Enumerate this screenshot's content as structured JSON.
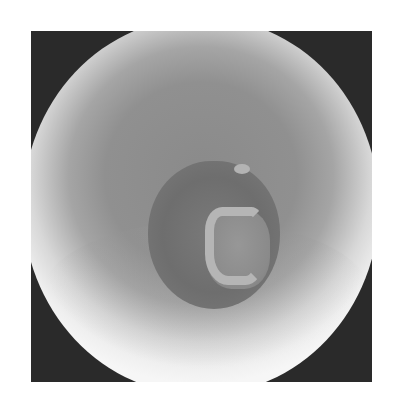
{
  "image": {
    "description": "Grayscale photograph looking down into a round vessel with a dark central pit containing a pale hook-shaped structure",
    "colors": {
      "corner": "#2a2a2a",
      "rim": "#f2f2f2",
      "center": "#8a8a8a",
      "structure": "#b5b5b5"
    }
  }
}
